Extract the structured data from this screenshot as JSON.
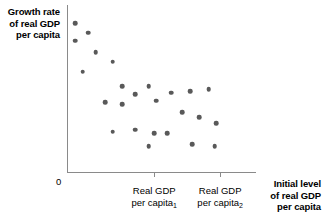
{
  "figure": {
    "ylabel_lines": [
      "Growth rate",
      "of real GDP",
      "per capita"
    ],
    "origin_label": "0",
    "xtitle_lines": [
      "Initial level",
      "of real GDP",
      "per capita"
    ],
    "xtick_captions": [
      {
        "line1": "Real GDP",
        "line2_text": "per capita",
        "line2_sub": "1"
      },
      {
        "line1": "Real GDP",
        "line2_text": "per capita",
        "line2_sub": "2"
      }
    ]
  },
  "chart_data": {
    "type": "scatter",
    "title": "",
    "xlabel": "Initial level of real GDP per capita",
    "ylabel": "Growth rate of real GDP per capita",
    "grid": false,
    "legend": "none",
    "axis_origin_label": "0",
    "xlim": [
      0,
      100
    ],
    "ylim": [
      0,
      100
    ],
    "xticks": [
      {
        "value": 46,
        "label": "Real GDP per capita₁"
      },
      {
        "value": 81,
        "label": "Real GDP per capita₂"
      }
    ],
    "marker_color": "#595959",
    "points": [
      {
        "x": 4,
        "y": 92
      },
      {
        "x": 11,
        "y": 86
      },
      {
        "x": 4,
        "y": 81
      },
      {
        "x": 15,
        "y": 74
      },
      {
        "x": 24,
        "y": 68
      },
      {
        "x": 8,
        "y": 62
      },
      {
        "x": 29,
        "y": 53
      },
      {
        "x": 36,
        "y": 48
      },
      {
        "x": 43,
        "y": 53
      },
      {
        "x": 20,
        "y": 43
      },
      {
        "x": 29,
        "y": 42
      },
      {
        "x": 47,
        "y": 44
      },
      {
        "x": 55,
        "y": 49
      },
      {
        "x": 65,
        "y": 50
      },
      {
        "x": 75,
        "y": 51
      },
      {
        "x": 61,
        "y": 37
      },
      {
        "x": 70,
        "y": 34
      },
      {
        "x": 79,
        "y": 30
      },
      {
        "x": 24,
        "y": 25
      },
      {
        "x": 36,
        "y": 26
      },
      {
        "x": 46,
        "y": 24
      },
      {
        "x": 53,
        "y": 24
      },
      {
        "x": 43,
        "y": 16
      },
      {
        "x": 66,
        "y": 17
      },
      {
        "x": 78,
        "y": 16
      }
    ]
  }
}
